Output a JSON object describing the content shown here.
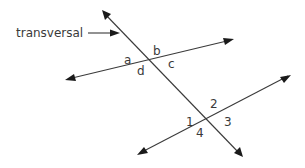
{
  "diagram": {
    "title_label": "transversal",
    "colors": {
      "line": "#3a3a3a",
      "arrowhead": "#1a1a1a",
      "text": "#3a3a3a",
      "background": "#ffffff"
    },
    "lines": [
      {
        "id": "transversal",
        "from": [
          102,
          10
        ],
        "to": [
          243,
          157
        ]
      },
      {
        "id": "line-upper",
        "from": [
          65,
          80
        ],
        "to": [
          234,
          39
        ]
      },
      {
        "id": "line-lower",
        "from": [
          137,
          155
        ],
        "to": [
          291,
          75
        ]
      }
    ],
    "upper_intersection_angles": {
      "a": "a",
      "b": "b",
      "c": "c",
      "d": "d"
    },
    "lower_intersection_angles": {
      "one": "1",
      "two": "2",
      "three": "3",
      "four": "4"
    }
  }
}
